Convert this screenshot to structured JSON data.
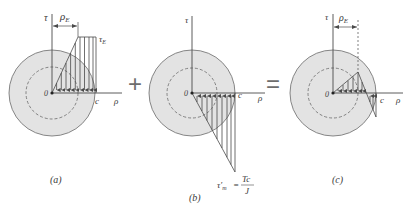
{
  "figure": {
    "colors": {
      "shaft_fill": "#e3e3e3",
      "line": "#4a4a4a",
      "dashed": "#6a6a6a",
      "text": "#3a3a3a"
    },
    "operators": {
      "plus": "+",
      "equals": "="
    },
    "panels": [
      {
        "id": "a",
        "caption": "(a)",
        "axis_vertical": "τ",
        "axis_horizontal": "ρ",
        "origin_label": "0",
        "radius_label": "c",
        "dimension_label": "ρ",
        "dimension_sub": "E",
        "stress_label": "τ",
        "stress_sub": "E"
      },
      {
        "id": "b",
        "caption": "(b)",
        "axis_vertical": "τ",
        "axis_horizontal": "ρ",
        "origin_label": "0",
        "radius_label": "c",
        "stress_label_main": "τ′",
        "stress_label_sub": "m",
        "equals": "=",
        "formula_num": "Tc",
        "formula_den": "J"
      },
      {
        "id": "c",
        "caption": "(c)",
        "axis_vertical": "τ",
        "axis_horizontal": "ρ",
        "origin_label": "0",
        "radius_label": "c",
        "dimension_label": "ρ",
        "dimension_sub": "E"
      }
    ]
  }
}
